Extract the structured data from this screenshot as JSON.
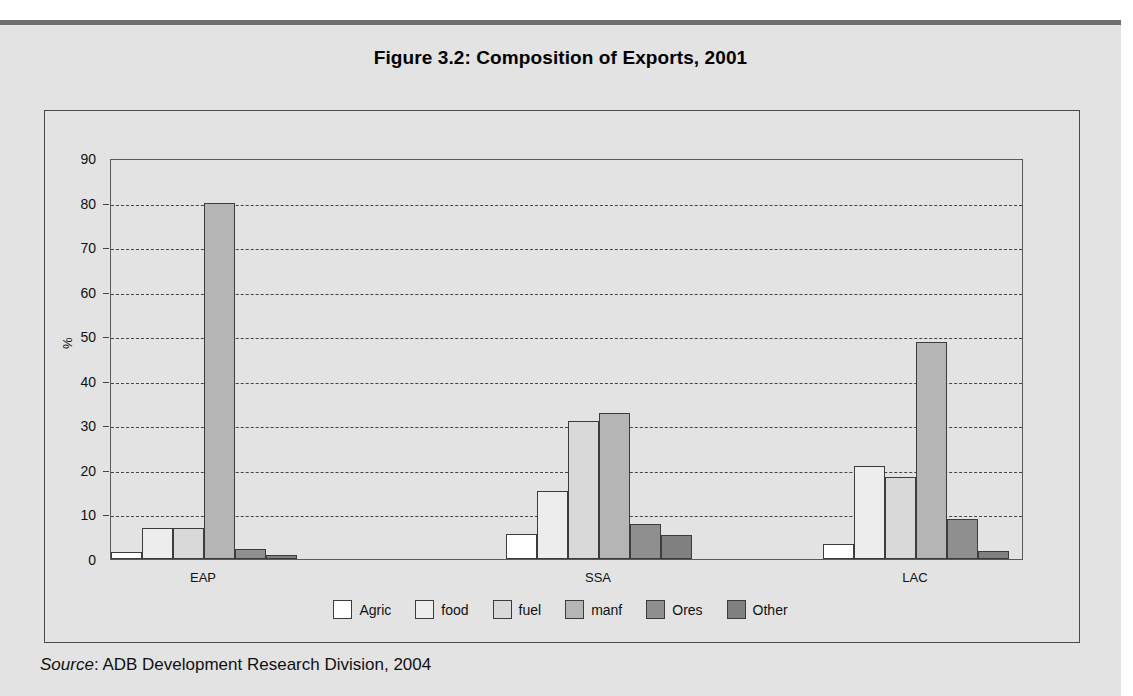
{
  "figure": {
    "title": "Figure 3.2:  Composition of Exports, 2001"
  },
  "source": {
    "label": "Source",
    "text": ": ADB Development Research Division, 2004"
  },
  "chart_data": {
    "type": "bar",
    "title": "Figure 3.2:  Composition of Exports, 2001",
    "xlabel": "",
    "ylabel": "%",
    "ylim": [
      0,
      90
    ],
    "yticks": [
      0,
      10,
      20,
      30,
      40,
      50,
      60,
      70,
      80,
      90
    ],
    "ytick_labels": [
      "0",
      "10",
      "20",
      "30",
      "40",
      "50",
      "60",
      "70",
      "80",
      "90"
    ],
    "grid": true,
    "grid_style": "dashed-horizontal",
    "legend_position": "bottom-center",
    "categories": [
      "EAP",
      "SSA",
      "LAC"
    ],
    "series": [
      {
        "name": "Agric",
        "color": "#ffffff",
        "values": [
          1.5,
          5.7,
          3.3
        ]
      },
      {
        "name": "food",
        "color": "#ededed",
        "values": [
          6.9,
          15.2,
          20.8
        ]
      },
      {
        "name": "fuel",
        "color": "#d9d9d9",
        "values": [
          7.0,
          31.0,
          18.5
        ]
      },
      {
        "name": "manf",
        "color": "#b5b5b5",
        "values": [
          80.0,
          32.7,
          48.8
        ]
      },
      {
        "name": "Ores",
        "color": "#8f8f8f",
        "values": [
          2.2,
          7.8,
          9.0
        ]
      },
      {
        "name": "Other",
        "color": "#808080",
        "values": [
          0.8,
          5.3,
          1.8
        ]
      }
    ]
  },
  "colors": {
    "page_background": "#e3e3e3",
    "top_rule": "#6e6e6e",
    "frame_border": "#4a4a4a",
    "gridline": "#454545",
    "bar_outline": "#3c3c3c"
  }
}
